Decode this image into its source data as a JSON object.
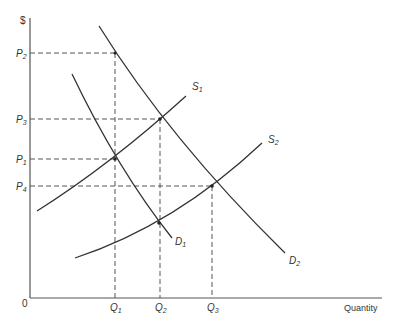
{
  "diagram": {
    "y_axis_label": "$",
    "x_axis_label": "Quantity",
    "origin_label": "0",
    "price_labels": [
      {
        "id": "P2",
        "main": "P",
        "sub": "2",
        "y": 53
      },
      {
        "id": "P3",
        "main": "P",
        "sub": "3",
        "y": 119
      },
      {
        "id": "P1",
        "main": "P",
        "sub": "1",
        "y": 159
      },
      {
        "id": "P4",
        "main": "P",
        "sub": "4",
        "y": 186
      }
    ],
    "quantity_labels": [
      {
        "id": "Q1",
        "main": "Q",
        "sub": "1",
        "x": 115
      },
      {
        "id": "Q2",
        "main": "Q",
        "sub": "2",
        "x": 160
      },
      {
        "id": "Q3",
        "main": "Q",
        "sub": "3",
        "x": 212
      }
    ],
    "curves": [
      {
        "id": "S1",
        "main": "S",
        "sub": "1",
        "type": "supply"
      },
      {
        "id": "S2",
        "main": "S",
        "sub": "2",
        "type": "supply"
      },
      {
        "id": "D1",
        "main": "D",
        "sub": "1",
        "type": "demand"
      },
      {
        "id": "D2",
        "main": "D",
        "sub": "2",
        "type": "demand"
      }
    ],
    "equilibria": [
      {
        "curves": "S1 x D1",
        "price": "P1",
        "quantity": "Q1"
      },
      {
        "curves": "S1 x D2",
        "price": "P3",
        "quantity": "Q2"
      },
      {
        "curves": "S2 x D2",
        "price": "P4",
        "quantity": "Q3"
      },
      {
        "curves": "D2 at Q1",
        "price": "P2",
        "quantity": "Q1"
      }
    ],
    "colors": {
      "line": "#333333",
      "dash": "#555555"
    }
  }
}
